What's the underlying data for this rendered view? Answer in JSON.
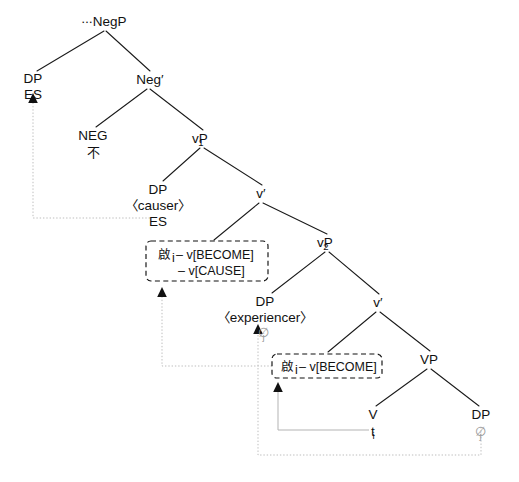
{
  "diagram": {
    "type": "syntactic-tree",
    "language_sample": "Chinese negation / causative structure",
    "nodes": {
      "root": {
        "label": "∙∙∙NegP",
        "x": 104,
        "y": 24
      },
      "dp_subject": {
        "label": "DP",
        "value": "ES",
        "x": 33,
        "y": 82
      },
      "neg_bar": {
        "label": "Neg′",
        "x": 148,
        "y": 82
      },
      "neg_head": {
        "label": "NEG",
        "value": "不",
        "x": 92,
        "y": 138
      },
      "vp1": {
        "label": "vP",
        "sub": "1",
        "x": 202,
        "y": 141
      },
      "dp_causer": {
        "label": "DP",
        "role": "〈causer〉",
        "value": "ES",
        "x": 158,
        "y": 192
      },
      "v_bar_1": {
        "label": "v′",
        "x": 261,
        "y": 196
      },
      "vp2": {
        "label": "vP",
        "sub": "2",
        "x": 327,
        "y": 245
      },
      "dp_experiencer": {
        "label": "DP",
        "role": "〈experiencer〉",
        "value": "∅",
        "sub": "j",
        "x": 265,
        "y": 304
      },
      "v_bar_2": {
        "label": "v′",
        "x": 378,
        "y": 305
      },
      "vp3": {
        "label": "VP",
        "x": 429,
        "y": 362
      },
      "v_head": {
        "label": "V",
        "value": "t",
        "sub": "i",
        "x": 372,
        "y": 417
      },
      "dp_object": {
        "label": "DP",
        "value": "∅",
        "sub": "j",
        "x": 481,
        "y": 417
      }
    },
    "boxes": [
      {
        "name": "complex-head-upper",
        "x": 146,
        "y": 241,
        "w": 122,
        "h": 40,
        "lines": [
          {
            "cjk": "啟",
            "sub": "i",
            "text": " – v[BECOME]"
          },
          {
            "cjk": "",
            "sub": "",
            "text": "– v[CAUSE]"
          }
        ]
      },
      {
        "name": "complex-head-lower",
        "x": 272,
        "y": 354,
        "w": 110,
        "h": 24,
        "lines": [
          {
            "cjk": "啟",
            "sub": "i",
            "text": " – v[BECOME]"
          }
        ]
      }
    ],
    "labels": {
      "negp": "∙∙∙NegP",
      "dp": "DP",
      "es": "ES",
      "neg_bar": "Neg′",
      "neg": "NEG",
      "bu": "不",
      "vp1": "vP",
      "vp1_sub": "1",
      "causer": "〈causer〉",
      "v_bar": "v′",
      "vp2": "vP",
      "vp2_sub": "2",
      "experiencer": "〈experiencer〉",
      "empty_j": "∅",
      "sub_j": "j",
      "vp": "VP",
      "v": "V",
      "trace_t": "t",
      "sub_i": "i",
      "qi": "啟",
      "become": " – v[BECOME]",
      "cause": "– v[CAUSE]"
    },
    "colors": {
      "branch": "#1a1a1a",
      "text": "#111111",
      "null_element": "#9a9a9a",
      "movement_line": "#bdbdbd",
      "box_border": "#111111",
      "background": "#ffffff"
    }
  }
}
